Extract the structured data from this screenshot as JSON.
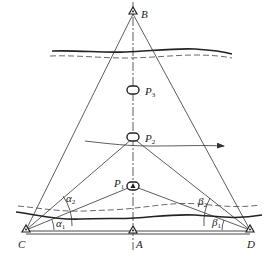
{
  "diagram": {
    "type": "survey-intersection-diagram",
    "colors": {
      "line": "#333333",
      "text": "#222222",
      "background": "#ffffff"
    },
    "points": {
      "B": {
        "label": "B",
        "x": 133,
        "y": 12
      },
      "A": {
        "label": "A",
        "x": 133,
        "y": 232
      },
      "C": {
        "label": "C",
        "x": 26,
        "y": 231
      },
      "D": {
        "label": "D",
        "x": 250,
        "y": 231
      }
    },
    "markers": [
      {
        "label": "P",
        "sub": "3",
        "x": 133,
        "y": 90
      },
      {
        "label": "P",
        "sub": "2",
        "x": 133,
        "y": 137
      },
      {
        "label": "P",
        "sub": "1",
        "x": 133,
        "y": 186
      }
    ],
    "angles": [
      {
        "label": "α",
        "sub": "2",
        "vertex": "C"
      },
      {
        "label": "α",
        "sub": "1",
        "vertex": "C"
      },
      {
        "label": "β",
        "sub": "2",
        "vertex": "D"
      },
      {
        "label": "β",
        "sub": "1",
        "vertex": "D"
      }
    ],
    "labels": {
      "B": "B",
      "A": "A",
      "C": "C",
      "D": "D",
      "P3": "P",
      "P3_sub": "3",
      "P2": "P",
      "P2_sub": "2",
      "P1": "P",
      "P1_sub": "1",
      "alpha2": "α",
      "alpha2_sub": "2",
      "alpha1": "α",
      "alpha1_sub": "1",
      "beta2": "β",
      "beta2_sub": "2",
      "beta1": "β",
      "beta1_sub": "1"
    },
    "flow_arrow": {
      "from": [
        85,
        140
      ],
      "to": [
        225,
        146
      ]
    }
  }
}
